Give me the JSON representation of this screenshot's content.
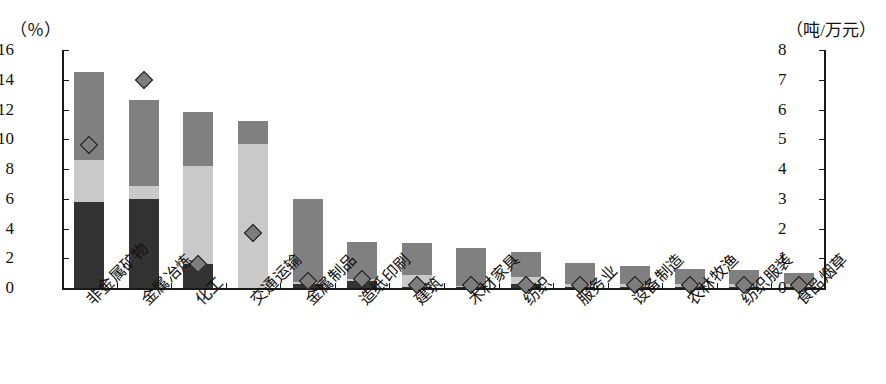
{
  "axes": {
    "left_unit": "（％）",
    "right_unit": "（吨/万元）",
    "left_ticks": [
      "16",
      "14",
      "12",
      "10",
      "8",
      "6",
      "4",
      "2",
      "0"
    ],
    "right_ticks": [
      "8",
      "7",
      "6",
      "5",
      "4",
      "3",
      "2",
      "1",
      "0"
    ]
  },
  "colors": {
    "segment_bottom": "#333333",
    "segment_middle": "#c9c9c9",
    "segment_top": "#808080",
    "marker_fill": "#7d7d7d",
    "marker_stroke": "#1a1a1a",
    "axis": "#1a1a1a",
    "background": "#ffffff"
  },
  "chart_data": {
    "type": "bar",
    "title": "",
    "subtitle": "",
    "xlabel": "",
    "ylabel": "（％）",
    "y2label": "（吨/万元）",
    "ylim": [
      0,
      16
    ],
    "y2lim": [
      0,
      8
    ],
    "grid": false,
    "legend_position": "none",
    "stacked": true,
    "categories": [
      "非金属矿物",
      "金属冶炼",
      "化工",
      "交通运输",
      "金属制品",
      "造纸印刷",
      "建筑",
      "木材家具",
      "纺织",
      "服务业",
      "设备制造",
      "农林牧渔",
      "纺织服装",
      "食品烟草"
    ],
    "series": [
      {
        "name": "segment-bottom",
        "axis": "left",
        "values": [
          5.8,
          6.0,
          1.6,
          0.0,
          0.3,
          0.5,
          0.1,
          0.05,
          0.3,
          0.05,
          0.05,
          0.05,
          0.05,
          0.05
        ]
      },
      {
        "name": "segment-middle",
        "axis": "left",
        "values": [
          2.8,
          0.85,
          6.6,
          9.7,
          0.1,
          0.1,
          0.75,
          0.1,
          0.45,
          0.25,
          0.25,
          0.2,
          0.2,
          0.2
        ]
      },
      {
        "name": "segment-top",
        "axis": "left",
        "values": [
          5.9,
          5.8,
          3.6,
          1.5,
          5.6,
          2.5,
          2.15,
          2.55,
          1.65,
          1.35,
          1.2,
          1.05,
          0.95,
          0.75
        ]
      },
      {
        "name": "marker-series",
        "axis": "right",
        "type": "scatter",
        "marker": "diamond",
        "values": [
          4.8,
          7.0,
          0.8,
          1.85,
          0.25,
          0.3,
          0.1,
          0.1,
          0.1,
          0.1,
          0.1,
          0.1,
          0.1,
          0.1
        ]
      }
    ],
    "totals": [
      14.5,
      12.65,
      11.8,
      11.2,
      6.0,
      3.1,
      3.0,
      2.7,
      2.4,
      1.65,
      1.5,
      1.3,
      1.2,
      1.0
    ]
  }
}
